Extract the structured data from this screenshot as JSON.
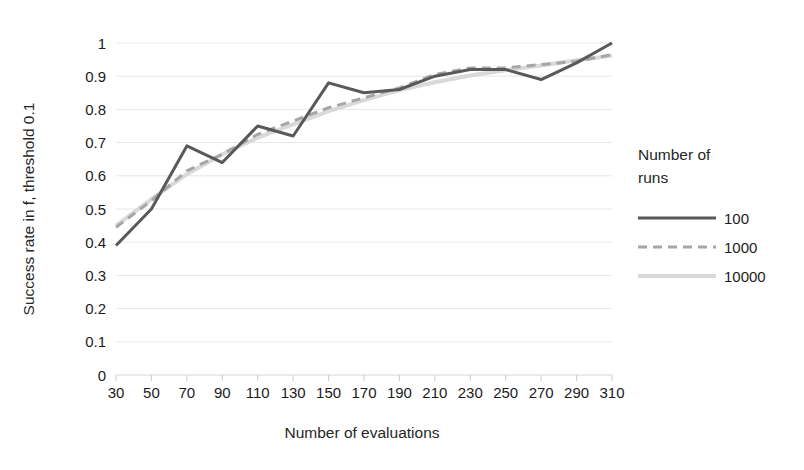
{
  "chart_data": {
    "type": "line",
    "title": "",
    "xlabel": "Number of evaluations",
    "ylabel": "Success rate in f, threshold 0.1",
    "x": [
      30,
      50,
      70,
      90,
      110,
      130,
      150,
      170,
      190,
      210,
      230,
      250,
      270,
      290,
      310
    ],
    "xticklabels": [
      "30",
      "50",
      "70",
      "90",
      "110",
      "130",
      "150",
      "170",
      "190",
      "210",
      "230",
      "250",
      "270",
      "290",
      "310"
    ],
    "yticklabels": [
      "0",
      "0.1",
      "0.2",
      "0.3",
      "0.4",
      "0.5",
      "0.6",
      "0.7",
      "0.8",
      "0.9",
      "1"
    ],
    "ylim": [
      0,
      1
    ],
    "xlim": [
      30,
      310
    ],
    "ytick_step": 0.1,
    "grid": "horizontal",
    "legend_position": "right",
    "legend_title": "Number of runs",
    "series": [
      {
        "name": "100",
        "style": "solid",
        "color": "#595959",
        "width": 3,
        "values": [
          0.39,
          0.5,
          0.69,
          0.64,
          0.75,
          0.72,
          0.88,
          0.85,
          0.86,
          0.9,
          0.92,
          0.92,
          0.89,
          0.94,
          1.0
        ]
      },
      {
        "name": "1000",
        "style": "dashed",
        "color": "#a6a6a6",
        "width": 3,
        "values": [
          0.445,
          0.525,
          0.615,
          0.665,
          0.725,
          0.765,
          0.805,
          0.835,
          0.865,
          0.905,
          0.925,
          0.925,
          0.935,
          0.945,
          0.965
        ]
      },
      {
        "name": "10000",
        "style": "solid",
        "color": "#d9d9d9",
        "width": 4,
        "values": [
          0.45,
          0.53,
          0.605,
          0.665,
          0.715,
          0.755,
          0.795,
          0.828,
          0.858,
          0.882,
          0.902,
          0.918,
          0.932,
          0.948,
          0.962
        ]
      }
    ]
  },
  "axes": {
    "ylabel": "Success rate in f, threshold 0.1",
    "xlabel": "Number of evaluations"
  },
  "legend": {
    "title_line1": "Number of",
    "title_line2": "runs",
    "entries": [
      {
        "label": "100"
      },
      {
        "label": "1000"
      },
      {
        "label": "10000"
      }
    ]
  },
  "colors": {
    "series_100": "#595959",
    "series_1000": "#a6a6a6",
    "series_10000": "#d9d9d9",
    "grid": "#e4e7ea",
    "text": "#1b1b1b",
    "background": "#ffffff"
  }
}
